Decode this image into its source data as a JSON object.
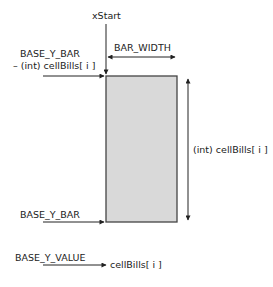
{
  "diagram": {
    "labels": {
      "x_start": "xStart",
      "bar_width": "BAR_WIDTH",
      "top_line1": "BASE_Y_BAR",
      "top_line2": "– (int) cellBills[ i ]",
      "bar_height": "(int)  cellBills[ i ]",
      "base_y_bar": "BASE_Y_BAR",
      "base_y_value": "BASE_Y_VALUE",
      "value_text": "cellBills[ i ]"
    },
    "colors": {
      "bar_fill": "#d9d9d9",
      "bar_stroke": "#444444",
      "line": "#222222"
    }
  }
}
